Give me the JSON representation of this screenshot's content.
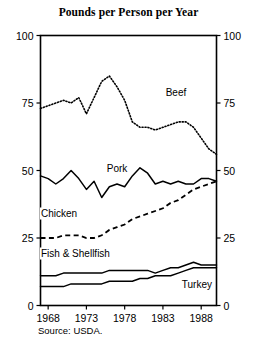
{
  "figure": {
    "title": "Pounds per Person per Year",
    "source_note": "Source: USDA."
  },
  "axes": {
    "left_ticks": [
      "100",
      "75",
      "50",
      "25",
      "0"
    ],
    "right_ticks": [
      "100",
      "75",
      "50",
      "25",
      "0"
    ],
    "x_ticks": [
      "1968",
      "1973",
      "1978",
      "1983",
      "1988"
    ]
  },
  "labels": {
    "beef": "Beef",
    "pork": "Pork",
    "chicken": "Chicken",
    "fish": "Fish & Shellfish",
    "turkey": "Turkey"
  },
  "chart_data": {
    "type": "line",
    "title": "Pounds per Person per Year",
    "xlabel": "",
    "ylabel": "Pounds per Person per Year",
    "xlim": [
      1967,
      1990
    ],
    "ylim": [
      0,
      100
    ],
    "grid": false,
    "legend": "inline-labels",
    "annotation": "Source: USDA.",
    "x": [
      1967,
      1968,
      1969,
      1970,
      1971,
      1972,
      1973,
      1974,
      1975,
      1976,
      1977,
      1978,
      1979,
      1980,
      1981,
      1982,
      1983,
      1984,
      1985,
      1986,
      1987,
      1988,
      1989,
      1990
    ],
    "series": [
      {
        "name": "Beef",
        "style": "dotted",
        "color": "#000000",
        "values": [
          73,
          74,
          75,
          76,
          75,
          77,
          71,
          77,
          83,
          85,
          81,
          76,
          68,
          66,
          66,
          65,
          66,
          67,
          68,
          68,
          66,
          62,
          58,
          56
        ]
      },
      {
        "name": "Pork",
        "style": "solid",
        "color": "#000000",
        "values": [
          48,
          47,
          45,
          47,
          50,
          47,
          43,
          46,
          40,
          44,
          45,
          44,
          48,
          51,
          49,
          45,
          46,
          45,
          46,
          45,
          45,
          47,
          47,
          46
        ]
      },
      {
        "name": "Chicken",
        "style": "dashed",
        "color": "#000000",
        "values": [
          25,
          25,
          25,
          26,
          26,
          26,
          25,
          25,
          26,
          28,
          29,
          30,
          32,
          33,
          34,
          35,
          36,
          38,
          39,
          41,
          43,
          44,
          45,
          46
        ]
      },
      {
        "name": "Fish & Shellfish",
        "style": "solid",
        "color": "#000000",
        "values": [
          11,
          11,
          11,
          12,
          12,
          12,
          12,
          12,
          12,
          13,
          13,
          13,
          13,
          13,
          13,
          12,
          13,
          14,
          14,
          15,
          16,
          15,
          15,
          15
        ]
      },
      {
        "name": "Turkey",
        "style": "solid",
        "color": "#000000",
        "values": [
          7,
          7,
          7,
          7,
          8,
          8,
          8,
          8,
          8,
          9,
          9,
          9,
          9,
          10,
          10,
          11,
          11,
          11,
          12,
          13,
          14,
          14,
          14,
          14
        ]
      }
    ]
  }
}
